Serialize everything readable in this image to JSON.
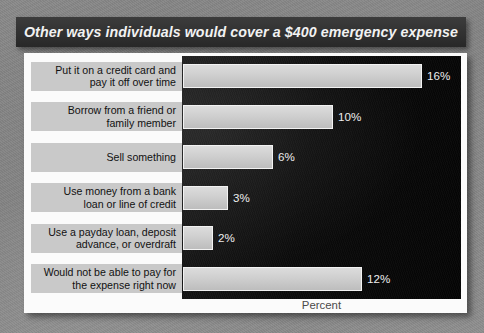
{
  "banner": {
    "title": "Other ways individuals would cover a $400 emergency expense"
  },
  "chart_data": {
    "type": "bar",
    "orientation": "horizontal",
    "title": "Other ways individuals would cover a $400 emergency expense",
    "xlabel": "Percent",
    "ylabel": "",
    "xlim": [
      0,
      18
    ],
    "grid": false,
    "legend": null,
    "categories": [
      "Put it on a credit card and pay it off over time",
      "Borrow from a friend or family member",
      "Sell something",
      "Use money from a bank loan or line of credit",
      "Use a payday loan, deposit advance, or overdraft",
      "Would not be able to pay for the expense right now"
    ],
    "category_lines": [
      [
        "Put it on a credit card and",
        "pay it off over time"
      ],
      [
        "Borrow from a friend or",
        "family member"
      ],
      [
        "Sell something"
      ],
      [
        "Use money from a bank",
        "loan or line of credit"
      ],
      [
        "Use a payday loan, deposit",
        "advance, or overdraft"
      ],
      [
        "Would not be able to pay for",
        "the expense right now"
      ]
    ],
    "values": [
      16,
      10,
      6,
      3,
      2,
      12
    ],
    "value_labels": [
      "16%",
      "10%",
      "6%",
      "3%",
      "2%",
      "12%"
    ]
  },
  "colors": {
    "page_background": "#7e7e7e",
    "banner_background": "#313131",
    "banner_text": "#f2f2f2",
    "card_background": "#fbfbfb",
    "plot_background": "#0b0b0b",
    "bar_fill": "#cfcfcf",
    "label_chip": "#c9c9c9",
    "value_text": "#ededed",
    "axis_title_text": "#4a4a4a"
  }
}
